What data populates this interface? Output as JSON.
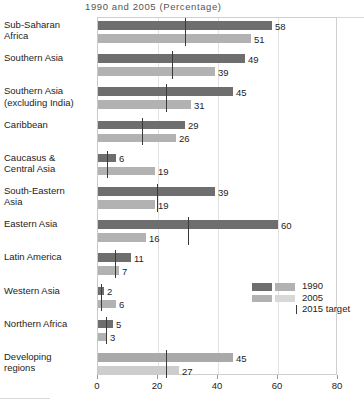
{
  "chart_data": {
    "type": "bar",
    "title": "1990 and 2005 (Percentage)",
    "xlabel": "",
    "ylabel": "",
    "xlim": [
      0,
      80
    ],
    "xticks": [
      0,
      20,
      40,
      60,
      80
    ],
    "grid": true,
    "orientation": "horizontal",
    "legend_position": "inside-right-middle",
    "categories": [
      "Sub-Saharan Africa",
      "Southern Asia",
      "Southern Asia (excluding India)",
      "Caribbean",
      "Caucasus & Central Asia",
      "South-Eastern Asia",
      "Eastern Asia",
      "Latin America",
      "Western Asia",
      "Northern Africa",
      "Developing regions"
    ],
    "series": [
      {
        "name": "1990",
        "color": "#6e6e6e",
        "values": [
          58,
          49,
          45,
          29,
          6,
          39,
          60,
          11,
          2,
          5,
          45
        ]
      },
      {
        "name": "2005",
        "color": "#b2b2b2",
        "values": [
          51,
          39,
          31,
          26,
          19,
          19,
          16,
          7,
          6,
          3,
          27
        ]
      }
    ],
    "target_marker": {
      "name": "2015 target",
      "color": "#3a3a3a",
      "values": [
        29,
        24.5,
        22.5,
        14.5,
        3,
        19.5,
        30,
        5.5,
        1,
        2.5,
        22.5
      ]
    },
    "legend_entries": [
      "1990",
      "2005",
      "2015 target"
    ]
  },
  "rows": [
    {
      "label_line1": "Sub-Saharan",
      "label_line2": "Africa",
      "v1990": "58",
      "v2005": "51"
    },
    {
      "label_line1": "Southern Asia",
      "label_line2": "",
      "v1990": "49",
      "v2005": "39"
    },
    {
      "label_line1": "Southern Asia",
      "label_line2": "(excluding India)",
      "v1990": "45",
      "v2005": "31"
    },
    {
      "label_line1": "Caribbean",
      "label_line2": "",
      "v1990": "29",
      "v2005": "26"
    },
    {
      "label_line1": "Caucasus &",
      "label_line2": "Central Asia",
      "v1990": "6",
      "v2005": "19"
    },
    {
      "label_line1": "South-Eastern",
      "label_line2": "Asia",
      "v1990": "39",
      "v2005": "19"
    },
    {
      "label_line1": "Eastern Asia",
      "label_line2": "",
      "v1990": "60",
      "v2005": "16"
    },
    {
      "label_line1": "Latin America",
      "label_line2": "",
      "v1990": "11",
      "v2005": "7"
    },
    {
      "label_line1": "Western Asia",
      "label_line2": "",
      "v1990": "2",
      "v2005": "6"
    },
    {
      "label_line1": "Northern Africa",
      "label_line2": "",
      "v1990": "5",
      "v2005": "3"
    },
    {
      "label_line1": "Developing",
      "label_line2": "regions",
      "v1990": "45",
      "v2005": "27"
    }
  ],
  "axis": {
    "labels": [
      "0",
      "20",
      "40",
      "60",
      "80"
    ]
  },
  "legend": {
    "items": [
      {
        "label": "1990"
      },
      {
        "label": "2005"
      },
      {
        "label": "2015 target"
      }
    ]
  }
}
